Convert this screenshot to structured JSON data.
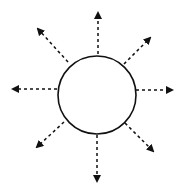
{
  "diagram": {
    "circle": {
      "cx": 97,
      "cy": 95,
      "r": 39,
      "stroke": "#111111",
      "fill": "#ffffff"
    },
    "arrows": [
      {
        "direction": "up",
        "x1": 98,
        "y1": 54,
        "x2": 98,
        "y2": 13
      },
      {
        "direction": "up-right",
        "x1": 124,
        "y1": 64,
        "x2": 150,
        "y2": 38
      },
      {
        "direction": "right",
        "x1": 136,
        "y1": 90,
        "x2": 172,
        "y2": 90
      },
      {
        "direction": "down-right",
        "x1": 125,
        "y1": 123,
        "x2": 153,
        "y2": 151
      },
      {
        "direction": "down",
        "x1": 97,
        "y1": 135,
        "x2": 97,
        "y2": 181
      },
      {
        "direction": "down-left",
        "x1": 64,
        "y1": 122,
        "x2": 37,
        "y2": 147
      },
      {
        "direction": "left",
        "x1": 57,
        "y1": 89,
        "x2": 13,
        "y2": 89
      },
      {
        "direction": "up-left",
        "x1": 68,
        "y1": 62,
        "x2": 38,
        "y2": 29
      }
    ],
    "stroke_color": "#111111"
  }
}
